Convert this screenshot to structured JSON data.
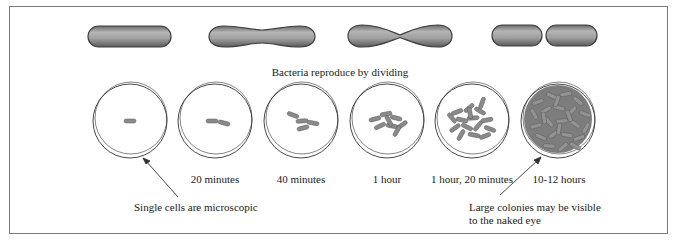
{
  "diagram": {
    "title": "Bacteria reproduce by dividing",
    "division_stages": [
      {
        "name": "single-rod"
      },
      {
        "name": "elongating-pinched"
      },
      {
        "name": "deeply-pinched"
      },
      {
        "name": "two-daughter-cells"
      }
    ],
    "dishes": [
      {
        "time_label": "",
        "cell_count_approx": 1
      },
      {
        "time_label": "20 minutes",
        "cell_count_approx": 2
      },
      {
        "time_label": "40 minutes",
        "cell_count_approx": 4
      },
      {
        "time_label": "1 hour",
        "cell_count_approx": 8
      },
      {
        "time_label": "1 hour, 20 minutes",
        "cell_count_approx": 16
      },
      {
        "time_label": "10-12 hours",
        "cell_count_approx": "colony"
      }
    ],
    "annotations": {
      "single_cells": "Single cells are microscopic",
      "colonies_line1": "Large colonies may be visible",
      "colonies_line2": "to the naked eye"
    },
    "colors": {
      "bacterium_fill": "#8f8f8f",
      "bacterium_outline": "#4a4a4a",
      "dish_outline": "#333333",
      "frame": "#7a7a7a"
    }
  }
}
